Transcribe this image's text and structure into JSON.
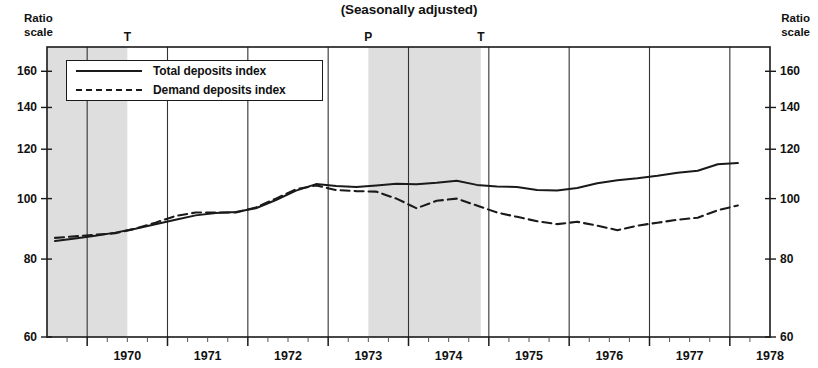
{
  "chart": {
    "title": "(Seasonally adjusted)",
    "scale_label_left": [
      "Ratio",
      "scale"
    ],
    "scale_label_right": [
      "Ratio",
      "scale"
    ],
    "legend": [
      {
        "key": "solid",
        "label": "Total deposits index"
      },
      {
        "key": "dash",
        "label": "Demand deposits index"
      }
    ],
    "cycle_markers": [
      {
        "label": "T",
        "x_year": 1970.5
      },
      {
        "label": "P",
        "x_year": 1973.5
      },
      {
        "label": "T",
        "x_year": 1974.9
      }
    ],
    "shaded_bands": [
      {
        "start": 1969.5,
        "end": 1970.5
      },
      {
        "start": 1973.5,
        "end": 1974.9
      }
    ]
  },
  "chart_data": {
    "type": "line",
    "title": "(Seasonally adjusted)",
    "xlabel": "",
    "ylabel": "Ratio scale",
    "yscale": "log",
    "ylim": [
      60,
      175
    ],
    "yticks": [
      60,
      80,
      100,
      120,
      140,
      160
    ],
    "xlim": [
      1969.5,
      1978.5
    ],
    "xticks": [
      1970,
      1971,
      1972,
      1973,
      1974,
      1975,
      1976,
      1977,
      1978
    ],
    "xtick_labels": [
      "1970",
      "1971",
      "1972",
      "1973",
      "1974",
      "1975",
      "1976",
      "1977",
      "1978"
    ],
    "minor_xticks_per_year": 4,
    "grid": true,
    "legend_position": "upper-left",
    "series": [
      {
        "name": "Total deposits index",
        "style": "solid",
        "x": [
          1969.6,
          1969.85,
          1970.1,
          1970.35,
          1970.6,
          1970.85,
          1971.1,
          1971.35,
          1971.6,
          1971.85,
          1972.1,
          1972.35,
          1972.6,
          1972.85,
          1973.1,
          1973.35,
          1973.6,
          1973.85,
          1974.1,
          1974.35,
          1974.6,
          1974.85,
          1975.1,
          1975.35,
          1975.6,
          1975.85,
          1976.1,
          1976.35,
          1976.6,
          1976.85,
          1977.1,
          1977.35,
          1977.6,
          1977.85,
          1978.1
        ],
        "y": [
          85.5,
          86.3,
          87.2,
          88.2,
          89.5,
          91.0,
          92.5,
          94.0,
          94.8,
          95.2,
          96.5,
          99.5,
          103.0,
          105.5,
          104.8,
          104.4,
          105.0,
          105.6,
          105.4,
          106.0,
          106.8,
          105.2,
          104.6,
          104.4,
          103.2,
          103.0,
          104.0,
          105.8,
          107.0,
          107.8,
          108.8,
          110.0,
          110.8,
          113.5,
          114.0
        ]
      },
      {
        "name": "Demand deposits index",
        "style": "dashed",
        "x": [
          1969.6,
          1969.85,
          1970.1,
          1970.35,
          1970.6,
          1970.85,
          1971.1,
          1971.35,
          1971.6,
          1971.85,
          1972.1,
          1972.35,
          1972.6,
          1972.85,
          1973.1,
          1973.35,
          1973.6,
          1973.85,
          1974.1,
          1974.35,
          1974.6,
          1974.85,
          1975.1,
          1975.35,
          1975.6,
          1975.85,
          1976.1,
          1976.35,
          1976.6,
          1976.85,
          1977.1,
          1977.35,
          1977.6,
          1977.85,
          1978.1
        ],
        "y": [
          86.5,
          87.0,
          87.5,
          88.0,
          89.5,
          91.5,
          93.8,
          95.0,
          95.0,
          95.0,
          96.8,
          100.0,
          103.5,
          105.0,
          103.2,
          102.8,
          102.6,
          100.0,
          96.5,
          99.2,
          100.0,
          97.5,
          95.0,
          93.5,
          92.0,
          91.0,
          91.8,
          90.5,
          89.0,
          90.5,
          91.5,
          92.5,
          93.2,
          95.8,
          97.5
        ]
      }
    ],
    "final_values": {
      "total_deposits_index": 118.5,
      "demand_deposits_index": 103.5
    }
  }
}
